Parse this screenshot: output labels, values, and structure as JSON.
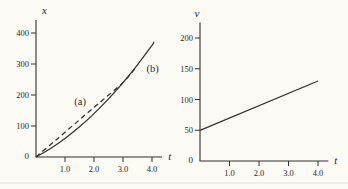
{
  "figure": {
    "background_color": "#fbfaf5",
    "ink_color": "#35312c",
    "page_rule_color": "#dcd8cc"
  },
  "chart_data": [
    {
      "id": "position-time",
      "type": "line",
      "title": "",
      "xlabel": "t",
      "ylabel": "x",
      "xlim": [
        0,
        4.35
      ],
      "ylim": [
        0,
        442
      ],
      "grid": false,
      "xticks": [
        {
          "value": 1,
          "label": "1.0"
        },
        {
          "value": 2,
          "label": "2.0"
        },
        {
          "value": 3,
          "label": "3.0"
        },
        {
          "value": 4,
          "label": "4.0"
        }
      ],
      "yticks": [
        {
          "value": 100,
          "label": "100"
        },
        {
          "value": 200,
          "label": "200"
        },
        {
          "value": 300,
          "label": "300"
        },
        {
          "value": 400,
          "label": "400"
        }
      ],
      "origin_label": "0",
      "series": [
        {
          "name": "(a)",
          "style": "dashed",
          "points": [
            [
              0,
              0
            ],
            [
              0.75,
              60
            ],
            [
              1.5,
              120
            ],
            [
              2.25,
              180
            ],
            [
              3,
              240
            ],
            [
              3.4,
              284
            ]
          ]
        },
        {
          "name": "(b)",
          "style": "solid",
          "points": [
            [
              0,
              0
            ],
            [
              0.5,
              27.5
            ],
            [
              1,
              60
            ],
            [
              1.5,
              97.5
            ],
            [
              2,
              140
            ],
            [
              2.5,
              187.5
            ],
            [
              3,
              240
            ],
            [
              3.5,
              297.5
            ],
            [
              4,
              360
            ],
            [
              4.07,
              372
            ]
          ]
        }
      ],
      "annotations": [
        {
          "text": "(a)",
          "x": 1.52,
          "y": 176
        },
        {
          "text": "(b)",
          "x": 4.02,
          "y": 283
        }
      ]
    },
    {
      "id": "velocity-time",
      "type": "line",
      "title": "",
      "xlabel": "t",
      "ylabel": "v",
      "xlim": [
        0,
        4.35
      ],
      "ylim": [
        0,
        225
      ],
      "grid": false,
      "xticks": [
        {
          "value": 1,
          "label": "1.0"
        },
        {
          "value": 2,
          "label": "2.0"
        },
        {
          "value": 3,
          "label": "3.0"
        },
        {
          "value": 4,
          "label": "4.0"
        }
      ],
      "yticks": [
        {
          "value": 50,
          "label": "50"
        },
        {
          "value": 100,
          "label": "100"
        },
        {
          "value": 150,
          "label": "150"
        },
        {
          "value": 200,
          "label": "200"
        }
      ],
      "origin_label": "0",
      "series": [
        {
          "name": "v(t)",
          "style": "solid",
          "points": [
            [
              0,
              50
            ],
            [
              4,
              130
            ]
          ]
        }
      ],
      "annotations": []
    }
  ]
}
